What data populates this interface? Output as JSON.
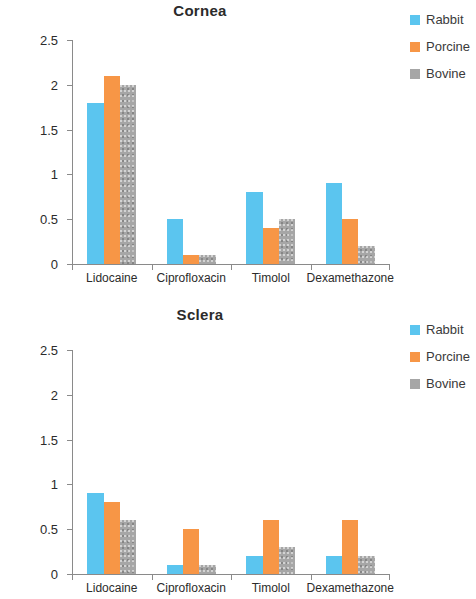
{
  "colors": {
    "rabbit": "#5bc5ef",
    "porcine": "#f79646",
    "bovine": "#a6a6a6",
    "axis": "#8a8a8a",
    "text": "#2b2b2b"
  },
  "legend": {
    "items": [
      {
        "label": "Rabbit",
        "color": "#5bc5ef"
      },
      {
        "label": "Porcine",
        "color": "#f79646"
      },
      {
        "label": "Bovine",
        "color": "#a6a6a6"
      }
    ]
  },
  "axis": {
    "ylabel_prefix": "D",
    "ylabel_sub": "eff",
    "ylabel_mid": ", cm",
    "ylabel_sup": "2",
    "ylabel_suffix": "/s",
    "yticklabels": [
      "0",
      "0.5",
      "1",
      "1.5",
      "2",
      "2.5"
    ]
  },
  "chart_data": [
    {
      "type": "bar",
      "title": "Cornea",
      "xlabel": "",
      "ylabel": "Deff, cm2/s",
      "ylim": [
        0,
        2.5
      ],
      "yticks": [
        0,
        0.5,
        1,
        1.5,
        2,
        2.5
      ],
      "grid": false,
      "legend_position": "right",
      "categories": [
        "Lidocaine",
        "Ciprofloxacin",
        "Timolol",
        "Dexamethazone"
      ],
      "series": [
        {
          "name": "Rabbit",
          "color": "#5bc5ef",
          "values": [
            1.8,
            0.5,
            0.8,
            0.9
          ]
        },
        {
          "name": "Porcine",
          "color": "#f79646",
          "values": [
            2.1,
            0.1,
            0.4,
            0.5
          ]
        },
        {
          "name": "Bovine",
          "color": "#a6a6a6",
          "values": [
            2.0,
            0.1,
            0.5,
            0.2
          ]
        }
      ]
    },
    {
      "type": "bar",
      "title": "Sclera",
      "xlabel": "",
      "ylabel": "Deff, cm2/s",
      "ylim": [
        0,
        2.5
      ],
      "yticks": [
        0,
        0.5,
        1,
        1.5,
        2,
        2.5
      ],
      "grid": false,
      "legend_position": "right",
      "categories": [
        "Lidocaine",
        "Ciprofloxacin",
        "Timolol",
        "Dexamethazone"
      ],
      "series": [
        {
          "name": "Rabbit",
          "color": "#5bc5ef",
          "values": [
            0.9,
            0.1,
            0.2,
            0.2
          ]
        },
        {
          "name": "Porcine",
          "color": "#f79646",
          "values": [
            0.8,
            0.5,
            0.6,
            0.6
          ]
        },
        {
          "name": "Bovine",
          "color": "#a6a6a6",
          "values": [
            0.6,
            0.1,
            0.3,
            0.2
          ]
        }
      ]
    }
  ]
}
